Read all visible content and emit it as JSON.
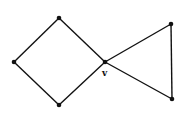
{
  "diagram": {
    "type": "graph",
    "colors": {
      "background": "#ffffff",
      "stroke": "#111111",
      "vertex": "#111111"
    },
    "vertices": [
      {
        "id": "left",
        "x": 14,
        "y": 62,
        "label": ""
      },
      {
        "id": "top",
        "x": 59,
        "y": 18,
        "label": ""
      },
      {
        "id": "bottom",
        "x": 59,
        "y": 105,
        "label": ""
      },
      {
        "id": "v",
        "x": 105,
        "y": 62,
        "label": "v"
      },
      {
        "id": "top-right",
        "x": 171,
        "y": 24,
        "label": ""
      },
      {
        "id": "bottom-right",
        "x": 172,
        "y": 99,
        "label": ""
      }
    ],
    "edges": [
      [
        "left",
        "top"
      ],
      [
        "top",
        "v"
      ],
      [
        "v",
        "bottom"
      ],
      [
        "bottom",
        "left"
      ],
      [
        "v",
        "top-right"
      ],
      [
        "top-right",
        "bottom-right"
      ],
      [
        "bottom-right",
        "v"
      ]
    ],
    "labels": {
      "cut_vertex": "v"
    }
  }
}
